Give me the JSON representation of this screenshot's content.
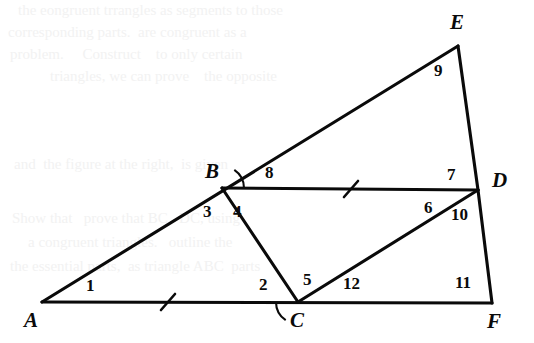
{
  "figure": {
    "canvas": {
      "width": 534,
      "height": 343
    },
    "stroke_color": "#0a0a0a",
    "background_color": "#ffffff",
    "vertices": [
      {
        "name": "A",
        "label": "A",
        "x": 42,
        "y": 302,
        "label_x": 24,
        "label_y": 310
      },
      {
        "name": "B",
        "label": "B",
        "x": 222,
        "y": 188,
        "label_x": 205,
        "label_y": 161
      },
      {
        "name": "C",
        "label": "C",
        "x": 298,
        "y": 302,
        "label_x": 290,
        "label_y": 310
      },
      {
        "name": "D",
        "label": "D",
        "x": 478,
        "y": 190,
        "label_x": 492,
        "label_y": 170
      },
      {
        "name": "E",
        "label": "E",
        "x": 458,
        "y": 46,
        "label_x": 450,
        "label_y": 12
      },
      {
        "name": "F",
        "label": "F",
        "x": 492,
        "y": 303,
        "label_x": 487,
        "label_y": 311
      }
    ],
    "segments": [
      {
        "name": "segment-A-E",
        "from": "A",
        "to": "E",
        "x1": 42,
        "y1": 302,
        "x2": 458,
        "y2": 46
      },
      {
        "name": "segment-A-F",
        "from": "A",
        "to": "F",
        "x1": 42,
        "y1": 302,
        "x2": 492,
        "y2": 303
      },
      {
        "name": "segment-B-D",
        "from": "B",
        "to": "D",
        "x1": 222,
        "y1": 188,
        "x2": 478,
        "y2": 190
      },
      {
        "name": "segment-B-C",
        "from": "B",
        "to": "C",
        "x1": 222,
        "y1": 188,
        "x2": 298,
        "y2": 302
      },
      {
        "name": "segment-C-D",
        "from": "C",
        "to": "D",
        "x1": 298,
        "y1": 302,
        "x2": 478,
        "y2": 190
      },
      {
        "name": "segment-E-D",
        "from": "E",
        "to": "D",
        "x1": 458,
        "y1": 46,
        "x2": 478,
        "y2": 190
      },
      {
        "name": "segment-D-F",
        "from": "D",
        "to": "F",
        "x1": 478,
        "y1": 190,
        "x2": 492,
        "y2": 303
      }
    ],
    "tick_marks": [
      {
        "name": "tick-mark-segment-AC",
        "on_segment": "A-C",
        "cx": 168,
        "cy": 302,
        "count": 1
      },
      {
        "name": "tick-mark-segment-BD",
        "on_segment": "B-D",
        "cx": 351,
        "cy": 189,
        "count": 1
      }
    ],
    "angle_arcs": [
      {
        "name": "angle-arc-4-at-B",
        "vertex": "B",
        "cx": 222,
        "cy": 188,
        "radius": 22,
        "start_deg": 0,
        "end_deg": 56
      },
      {
        "name": "angle-arc-2-at-C",
        "vertex": "C",
        "cx": 298,
        "cy": 302,
        "radius": 22,
        "start_deg": 180,
        "end_deg": 236
      }
    ],
    "angle_labels": [
      {
        "name": "angle-label-1",
        "text": "1",
        "at_vertex": "A",
        "x": 86,
        "y": 277
      },
      {
        "name": "angle-label-2",
        "text": "2",
        "at_vertex": "C",
        "x": 259,
        "y": 276
      },
      {
        "name": "angle-label-3",
        "text": "3",
        "at_vertex": "B",
        "x": 203,
        "y": 203
      },
      {
        "name": "angle-label-4",
        "text": "4",
        "at_vertex": "B",
        "x": 233,
        "y": 203
      },
      {
        "name": "angle-label-5",
        "text": "5",
        "at_vertex": "C",
        "x": 303,
        "y": 271
      },
      {
        "name": "angle-label-6",
        "text": "6",
        "at_vertex": "D",
        "x": 424,
        "y": 199
      },
      {
        "name": "angle-label-7",
        "text": "7",
        "at_vertex": "D",
        "x": 447,
        "y": 166
      },
      {
        "name": "angle-label-8",
        "text": "8",
        "at_vertex": "B",
        "x": 265,
        "y": 164
      },
      {
        "name": "angle-label-9",
        "text": "9",
        "at_vertex": "E",
        "x": 434,
        "y": 62
      },
      {
        "name": "angle-label-10",
        "text": "10",
        "at_vertex": "D",
        "x": 451,
        "y": 206
      },
      {
        "name": "angle-label-11",
        "text": "11",
        "at_vertex": "F",
        "x": 455,
        "y": 274
      },
      {
        "name": "angle-label-12",
        "text": "12",
        "at_vertex": "C",
        "x": 343,
        "y": 275
      }
    ],
    "show_through_lines": [
      {
        "name": "show-through-line-1",
        "text": "the eongruent trrangles as segments to those",
        "x": 18,
        "y": 2
      },
      {
        "name": "show-through-line-2",
        "text": "corresponding parts.  are congruent as a",
        "x": 8,
        "y": 24
      },
      {
        "name": "show-through-line-3",
        "text": "problem.     Construct    to only certain",
        "x": 10,
        "y": 46
      },
      {
        "name": "show-through-line-4",
        "text": "triangles, we can prove    the opposite",
        "x": 50,
        "y": 68
      },
      {
        "name": "show-through-line-5",
        "text": "and  the figure at the right,  is given",
        "x": 14,
        "y": 156
      },
      {
        "name": "show-through-line-6",
        "text": "Show that   prove that BC   DC, using",
        "x": 12,
        "y": 210
      },
      {
        "name": "show-through-line-7",
        "text": "a congruent triangles.   outline the",
        "x": 28,
        "y": 234
      },
      {
        "name": "show-through-line-8",
        "text": "the essential parts,  as triangle ABC  parts",
        "x": 10,
        "y": 258
      }
    ]
  }
}
